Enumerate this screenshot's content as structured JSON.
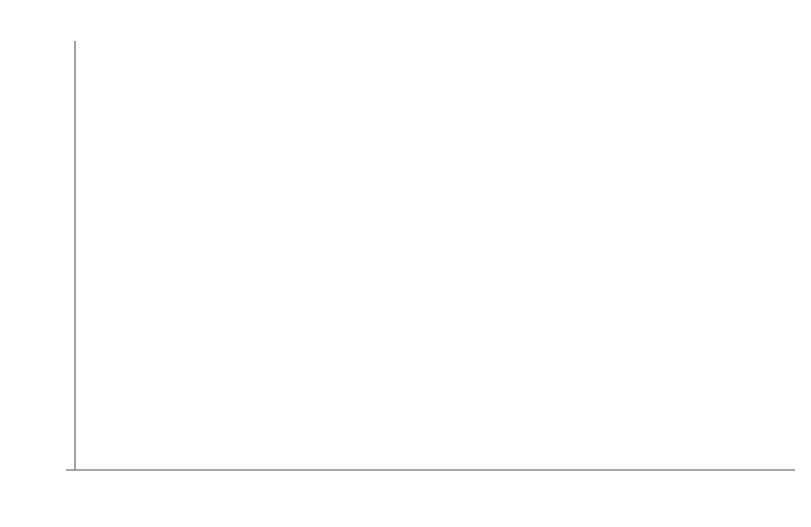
{
  "chart_data": {
    "type": "line",
    "title": "",
    "subtitle": "",
    "xlabel": "(年份)",
    "ylabel": "(%)",
    "categories": [
      "2011",
      "2012",
      "2013",
      "2014",
      "2015",
      "2016",
      "2017",
      "2018",
      "2019",
      "2020"
    ],
    "values": [
      20.85,
      18.59,
      23.06,
      16.58,
      16.77,
      23.46,
      21.41,
      18.22,
      15.53,
      14.23
    ],
    "series": [
      {
        "name": "",
        "values": [
          20.85,
          18.59,
          23.06,
          16.58,
          16.77,
          23.46,
          21.41,
          18.22,
          15.53,
          14.23
        ]
      }
    ],
    "data_labels": [
      "20.85",
      "18.59",
      "23.06",
      "16.58",
      "16.77",
      "23.46",
      "21.41",
      "18.22",
      "15.53",
      "14.23"
    ],
    "ylim": [
      10.0,
      26.0
    ],
    "ytick_step": 2.0,
    "ytick_labels": [
      "26.00",
      "24.00",
      "22.00",
      "20.00",
      "18.00",
      "16.00",
      "14.00",
      "12.00",
      "10.00"
    ],
    "ytick_values": [
      26.0,
      24.0,
      22.0,
      20.0,
      18.0,
      16.0,
      14.0,
      12.0,
      10.0
    ],
    "grid": false,
    "legend": "none",
    "marker": "diamond",
    "line_color": "#6b6b6b",
    "marker_color": "#5e5e5e",
    "axis_color": "#7a7a7a",
    "text_color": "#141414",
    "background": "#ffffff",
    "label_positions": [
      {
        "label": "20.85",
        "x": 124,
        "y": 189,
        "anchor": "right-of-point"
      },
      {
        "label": "18.59",
        "x": 194,
        "y": 258,
        "anchor": "right-of-point"
      },
      {
        "label": "23.06",
        "x": 265,
        "y": 135,
        "anchor": "right-of-point"
      },
      {
        "label": "16.58",
        "x": 303,
        "y": 341,
        "anchor": "below-point"
      },
      {
        "label": "16.77",
        "x": 404,
        "y": 306,
        "anchor": "right-of-point"
      },
      {
        "label": "23.46",
        "x": 473,
        "y": 121,
        "anchor": "right-of-point"
      },
      {
        "label": "21.41",
        "x": 543,
        "y": 178,
        "anchor": "right-of-point"
      },
      {
        "label": "18.22",
        "x": 610,
        "y": 262,
        "anchor": "right-of-point"
      },
      {
        "label": "15.53",
        "x": 682,
        "y": 338,
        "anchor": "right-of-point"
      },
      {
        "label": "14.23",
        "x": 748,
        "y": 375,
        "anchor": "right-of-point"
      }
    ]
  },
  "axis_geometry": {
    "plot_left": 74,
    "plot_right": 795,
    "plot_top": 41,
    "plot_bottom": 470,
    "x_first_tick": 101,
    "x_tick_spacing": 69.1
  }
}
